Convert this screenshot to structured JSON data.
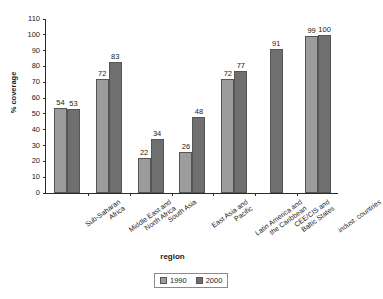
{
  "chart_data": {
    "type": "bar",
    "title": "",
    "xlabel": "region",
    "ylabel": "% coverage",
    "ylim": [
      0,
      110
    ],
    "ytick_values": [
      0,
      10,
      20,
      30,
      40,
      50,
      60,
      70,
      80,
      90,
      100,
      110
    ],
    "grid": false,
    "legend_position": "bottom",
    "categories": [
      "Sub-Saharan Africa",
      "Middle East and North Africa",
      "South Asia",
      "East Asia and Pacific",
      "Latin America and the Caribbean",
      "CEE/CIS and Baltic States",
      "indust. countries"
    ],
    "category_lines": [
      [
        "Sub-Saharan",
        "Africa"
      ],
      [
        "Middle East and",
        "North Africa"
      ],
      [
        "South Asia"
      ],
      [
        "East Asia and",
        "Pacific"
      ],
      [
        "Latin America and",
        "the Caribbean"
      ],
      [
        "CEE/CIS and",
        "Baltic States"
      ],
      [
        "indust. countries"
      ]
    ],
    "series": [
      {
        "name": "1990",
        "color": "#9c9c9c",
        "values": [
          54,
          72,
          22,
          26,
          72,
          null,
          99
        ]
      },
      {
        "name": "2000",
        "color": "#6f6f6f",
        "values": [
          53,
          83,
          34,
          48,
          77,
          91,
          100
        ]
      }
    ],
    "data_labels": [
      [
        "54",
        "53"
      ],
      [
        "72",
        "83"
      ],
      [
        "22",
        "34"
      ],
      [
        "26",
        "48"
      ],
      [
        "72",
        "77"
      ],
      [
        null,
        "91"
      ],
      [
        "99",
        "100"
      ]
    ]
  },
  "legend": {
    "entries": [
      {
        "label": "1990",
        "swatch": "light-gray-swatch"
      },
      {
        "label": "2000",
        "swatch": "dark-gray-swatch"
      }
    ]
  },
  "colors": {
    "series_1990": "#9c9c9c",
    "series_2000": "#6f6f6f",
    "axis": "#2b2b2b",
    "background": "#ffffff"
  }
}
